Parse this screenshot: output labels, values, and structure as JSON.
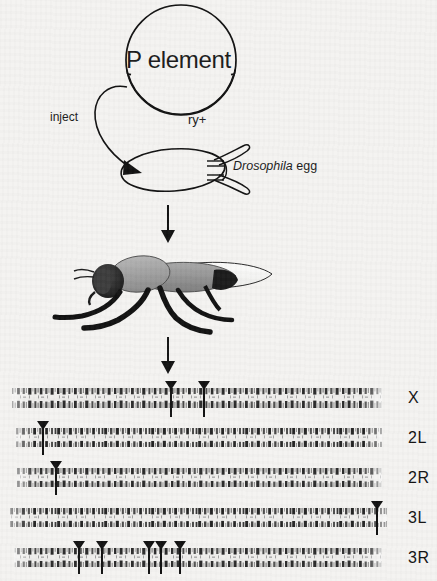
{
  "figure": {
    "title_text": "P element",
    "plasmid": {
      "name": "P element",
      "marker_label": "ry+"
    },
    "inject_label": "inject",
    "egg_label_italic": "Drosophila",
    "egg_label_plain": " egg",
    "arrows": [
      {
        "name": "inject-arrow",
        "from": "plasmid",
        "to": "egg"
      },
      {
        "name": "down-arrow-to-fly"
      },
      {
        "name": "down-arrow-to-chromosomes"
      }
    ],
    "fly": {
      "name": "adult-drosophila",
      "head_color": "#1d1d1d",
      "thorax_color": "#9b9b9b",
      "wing_color": "#fbfbfa",
      "leg_color": "#121212"
    },
    "chromosomes": [
      {
        "label": "X",
        "insertions": [
          0.432,
          0.52
        ]
      },
      {
        "label": "2L",
        "insertions": [
          0.086
        ]
      },
      {
        "label": "2R",
        "insertions": [
          0.12
        ]
      },
      {
        "label": "3L",
        "insertions": [
          0.935
        ]
      },
      {
        "label": "3R",
        "insertions": [
          0.178,
          0.24,
          0.367,
          0.4,
          0.452
        ]
      }
    ],
    "colors": {
      "background": "#f4f3f1",
      "ink": "#111111",
      "chromosome_band": "#2a2a2a"
    }
  }
}
